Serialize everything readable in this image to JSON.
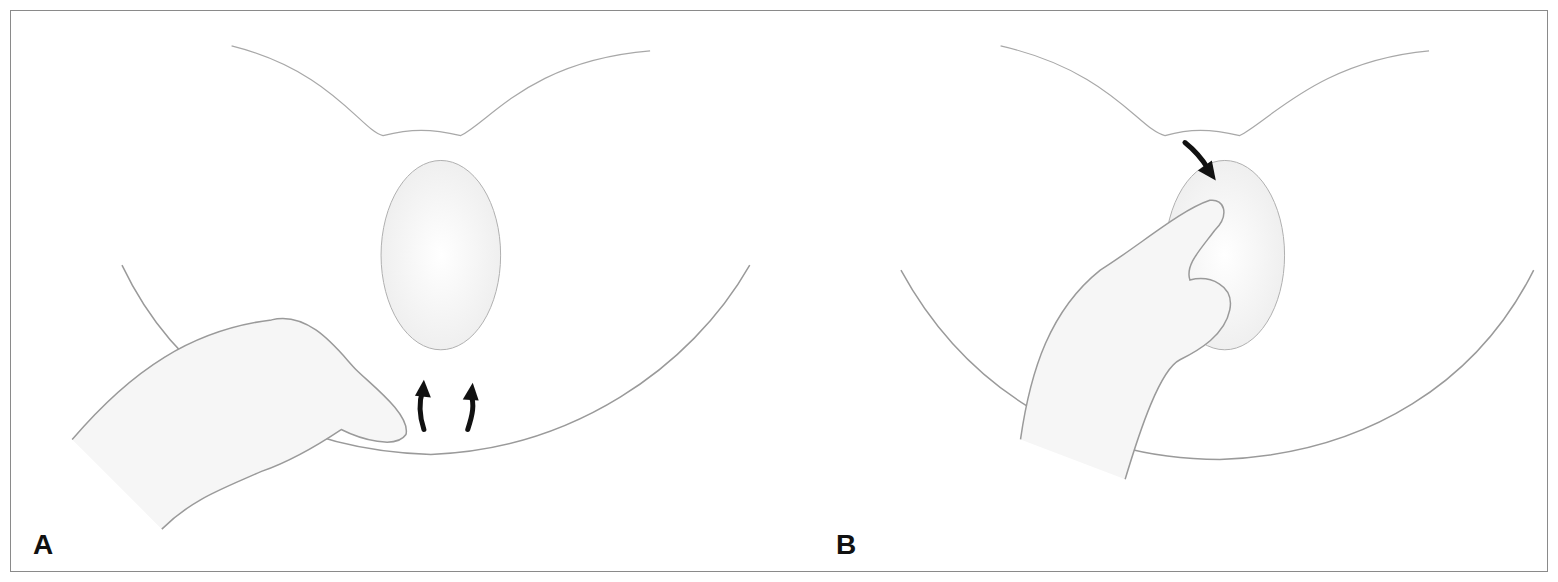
{
  "figure": {
    "type": "medical-illustration",
    "panels": [
      {
        "label": "A",
        "description": "Schematic anatomical line illustration; examiner's hand at lower left; two upward-pointing arrows indicating direction",
        "arrows": [
          {
            "direction": "up",
            "count": 2
          }
        ]
      },
      {
        "label": "B",
        "description": "Schematic anatomical line illustration; examiner's hand at center-left; one downward-right-pointing arrow indicating direction",
        "arrows": [
          {
            "direction": "down-right",
            "count": 1
          }
        ]
      }
    ],
    "colors": {
      "outline": "#9a9a9a",
      "shading": "#ececec",
      "arrow": "#111111",
      "border": "#8a8a8a"
    }
  }
}
